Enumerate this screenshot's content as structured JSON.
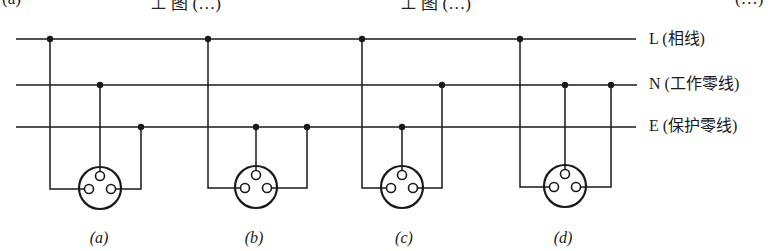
{
  "page": {
    "width": 774,
    "height": 251,
    "background": "#ffffff",
    "stroke_color": "#1a1a1a"
  },
  "top_fragments": [
    {
      "text": "(a)",
      "x": 2
    },
    {
      "text": "⊥ 图 (…)",
      "x": 150
    },
    {
      "text": "⊥ 图 (…)",
      "x": 400
    },
    {
      "text": "(…)",
      "x": 735
    }
  ],
  "buses": [
    {
      "id": "L",
      "label": "L (相线)",
      "name": "Phase line",
      "y": 39,
      "x_start": 16,
      "x_end": 636,
      "label_y": 30
    },
    {
      "id": "N",
      "label": "N (工作零线)",
      "name": "Working neutral",
      "y": 85,
      "x_start": 16,
      "x_end": 637,
      "label_y": 75
    },
    {
      "id": "E",
      "label": "E (保护零线)",
      "name": "Protective earth",
      "y": 127,
      "x_start": 16,
      "x_end": 636,
      "label_y": 117
    }
  ],
  "sockets": [
    {
      "label": "(a)",
      "letter": "a",
      "label_x": 99,
      "cx": 100,
      "cy": 188,
      "r": 21,
      "left_pin": {
        "bus": "L",
        "x": 50
      },
      "top_pin": {
        "bus": "N",
        "x": 100
      },
      "right_pin": {
        "bus": "E",
        "x": 141
      }
    },
    {
      "label": "(b)",
      "letter": "b",
      "label_x": 254,
      "cx": 256,
      "cy": 187,
      "r": 21,
      "left_pin": {
        "bus": "L",
        "x": 208
      },
      "top_pin": {
        "bus": "E",
        "x": 256
      },
      "right_pin": {
        "bus": "E",
        "x": 307
      }
    },
    {
      "label": "(c)",
      "letter": "c",
      "label_x": 404,
      "cx": 402,
      "cy": 187,
      "r": 21,
      "left_pin": {
        "bus": "L",
        "x": 362
      },
      "top_pin": {
        "bus": "E",
        "x": 402
      },
      "right_pin": {
        "bus": "N",
        "x": 442
      }
    },
    {
      "label": "(d)",
      "letter": "d",
      "label_x": 563,
      "cx": 565,
      "cy": 186,
      "r": 21,
      "left_pin": {
        "bus": "L",
        "x": 520
      },
      "top_pin": {
        "bus": "N",
        "x": 565
      },
      "right_pin": {
        "bus": "N",
        "x": 611
      }
    }
  ],
  "pin": {
    "radius": 4.5,
    "stroke_width": 1.6
  },
  "junction_dot_radius": 3.2
}
